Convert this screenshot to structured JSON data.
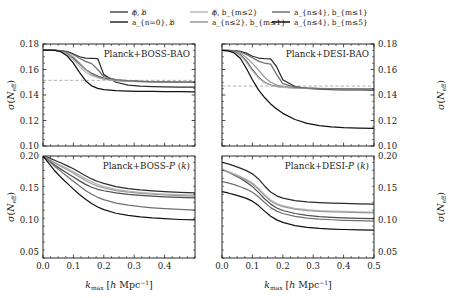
{
  "figure": {
    "xlabel": "k_max [h Mpc^-1]",
    "ylabel": "sigma(N_eff)"
  },
  "legend": {
    "entries": [
      {
        "id": "nophi-nob",
        "label": "ϕ̸, b̸",
        "color": "#4d4d4d"
      },
      {
        "id": "an0-nob",
        "label": "a_{n=0}, b̸",
        "color": "#2b2b2b"
      },
      {
        "id": "nophi-bm2",
        "label": "ϕ̸, b_{m≤2}",
        "color": "#b8b8b8"
      },
      {
        "id": "an2-bm1",
        "label": "a_{n≤2}, b_{m≤1}",
        "color": "#9a9a9a"
      },
      {
        "id": "an4-bm1",
        "label": "a_{n≤4}, b_{m≤1}",
        "color": "#707070"
      },
      {
        "id": "an4-bm5",
        "label": "a_{n≤4}, b_{m≤5}",
        "color": "#111111"
      }
    ]
  },
  "chart_data": [
    {
      "type": "line",
      "panel": "top-left",
      "title": "Planck+BOSS-BAO",
      "xlabel": "k_max [h Mpc^-1]",
      "ylabel": "sigma(N_eff)",
      "xlim": [
        0.0,
        0.5
      ],
      "ylim": [
        0.1,
        0.18
      ],
      "xticks": [
        0.0,
        0.1,
        0.2,
        0.3,
        0.4
      ],
      "yticks": [
        0.1,
        0.12,
        0.14,
        0.16,
        0.18
      ],
      "grid": false,
      "reference_line": {
        "y": 0.1515,
        "style": "dashed",
        "color": "#9a9a9a"
      },
      "x": [
        0.0,
        0.02,
        0.04,
        0.06,
        0.08,
        0.1,
        0.12,
        0.14,
        0.16,
        0.18,
        0.2,
        0.24,
        0.28,
        0.32,
        0.36,
        0.4,
        0.45,
        0.5
      ],
      "series": [
        {
          "name": "ϕ̸, b̸",
          "color": "#4d4d4d",
          "values": [
            0.1752,
            0.1752,
            0.175,
            0.1742,
            0.1724,
            0.1688,
            0.1645,
            0.16,
            0.157,
            0.1548,
            0.1532,
            0.1516,
            0.151,
            0.1506,
            0.1504,
            0.1502,
            0.1501,
            0.15
          ]
        },
        {
          "name": "a_{n=0}, b̸",
          "color": "#2b2b2b",
          "values": [
            0.1752,
            0.1752,
            0.1751,
            0.1748,
            0.174,
            0.1722,
            0.17,
            0.169,
            0.1688,
            0.1686,
            0.156,
            0.15,
            0.1478,
            0.147,
            0.1466,
            0.1464,
            0.1462,
            0.1461
          ]
        },
        {
          "name": "ϕ̸, b_{m≤2}",
          "color": "#b8b8b8",
          "values": [
            0.1752,
            0.1752,
            0.175,
            0.174,
            0.1716,
            0.1676,
            0.1622,
            0.1578,
            0.1552,
            0.1536,
            0.1524,
            0.1512,
            0.1507,
            0.1504,
            0.1502,
            0.1501,
            0.15,
            0.1499
          ]
        },
        {
          "name": "a_{n≤2}, b_{m≤1}",
          "color": "#9a9a9a",
          "values": [
            0.1752,
            0.1752,
            0.1751,
            0.1744,
            0.1728,
            0.1698,
            0.1652,
            0.16,
            0.1562,
            0.154,
            0.1527,
            0.1513,
            0.1508,
            0.1505,
            0.1503,
            0.1501,
            0.15,
            0.1499
          ]
        },
        {
          "name": "a_{n≤4}, b_{m≤1}",
          "color": "#707070",
          "values": [
            0.1752,
            0.1752,
            0.1751,
            0.1747,
            0.1737,
            0.1716,
            0.1688,
            0.1664,
            0.1646,
            0.16,
            0.1545,
            0.152,
            0.1512,
            0.1507,
            0.1505,
            0.1503,
            0.1501,
            0.15
          ]
        },
        {
          "name": "a_{n≤4}, b_{m≤5}",
          "color": "#111111",
          "values": [
            0.1752,
            0.1752,
            0.175,
            0.1738,
            0.1706,
            0.165,
            0.1578,
            0.1512,
            0.1472,
            0.1452,
            0.1442,
            0.1434,
            0.1431,
            0.1429,
            0.1428,
            0.1427,
            0.1426,
            0.1425
          ]
        }
      ]
    },
    {
      "type": "line",
      "panel": "top-right",
      "title": "Planck+DESI-BAO",
      "xlabel": "k_max [h Mpc^-1]",
      "ylabel": "sigma(N_eff)",
      "xlim": [
        0.0,
        0.5
      ],
      "ylim": [
        0.1,
        0.18
      ],
      "xticks": [
        0.0,
        0.1,
        0.2,
        0.3,
        0.4,
        0.5
      ],
      "yticks": [
        0.1,
        0.12,
        0.14,
        0.16,
        0.18
      ],
      "grid": false,
      "reference_line": {
        "y": 0.147,
        "style": "dashed",
        "color": "#9a9a9a"
      },
      "x": [
        0.0,
        0.02,
        0.04,
        0.06,
        0.08,
        0.1,
        0.12,
        0.14,
        0.16,
        0.18,
        0.2,
        0.24,
        0.28,
        0.32,
        0.36,
        0.4,
        0.45,
        0.5
      ],
      "series": [
        {
          "name": "ϕ̸, b̸",
          "color": "#4d4d4d",
          "values": [
            0.175,
            0.1748,
            0.174,
            0.1716,
            0.1668,
            0.16,
            0.154,
            0.15,
            0.1478,
            0.1468,
            0.1462,
            0.1456,
            0.1453,
            0.1451,
            0.145,
            0.1449,
            0.1448,
            0.1447
          ]
        },
        {
          "name": "a_{n=0}, b̸",
          "color": "#2b2b2b",
          "values": [
            0.175,
            0.175,
            0.1748,
            0.1742,
            0.1728,
            0.1704,
            0.169,
            0.1686,
            0.1684,
            0.162,
            0.152,
            0.1466,
            0.1452,
            0.1446,
            0.1443,
            0.1441,
            0.144,
            0.1439
          ]
        },
        {
          "name": "ϕ̸, b_{m≤2}",
          "color": "#b8b8b8",
          "values": [
            0.175,
            0.1748,
            0.1738,
            0.171,
            0.1656,
            0.159,
            0.1534,
            0.1496,
            0.1476,
            0.1466,
            0.146,
            0.1454,
            0.1452,
            0.145,
            0.1449,
            0.1448,
            0.1447,
            0.1446
          ]
        },
        {
          "name": "a_{n≤2}, b_{m≤1}",
          "color": "#9a9a9a",
          "values": [
            0.175,
            0.1749,
            0.1744,
            0.1728,
            0.1694,
            0.1648,
            0.1596,
            0.154,
            0.15,
            0.1478,
            0.1468,
            0.1458,
            0.1454,
            0.1452,
            0.145,
            0.1449,
            0.1448,
            0.1447
          ]
        },
        {
          "name": "a_{n≤4}, b_{m≤1}",
          "color": "#707070",
          "values": [
            0.175,
            0.175,
            0.1747,
            0.1738,
            0.1718,
            0.1692,
            0.1666,
            0.165,
            0.1642,
            0.156,
            0.149,
            0.1462,
            0.1454,
            0.1451,
            0.1449,
            0.1448,
            0.1447,
            0.1446
          ]
        },
        {
          "name": "a_{n≤4}, b_{m≤5}",
          "color": "#111111",
          "values": [
            0.175,
            0.1746,
            0.173,
            0.1688,
            0.161,
            0.152,
            0.144,
            0.138,
            0.133,
            0.129,
            0.1256,
            0.1208,
            0.1178,
            0.116,
            0.115,
            0.1144,
            0.114,
            0.1138
          ]
        }
      ]
    },
    {
      "type": "line",
      "panel": "bottom-left",
      "title": "Planck+BOSS-P (k)",
      "xlabel": "k_max [h Mpc^-1]",
      "ylabel": "sigma(N_eff)",
      "xlim": [
        0.0,
        0.5
      ],
      "ylim": [
        0.04,
        0.2
      ],
      "xticks": [
        0.0,
        0.1,
        0.2,
        0.3,
        0.4
      ],
      "yticks": [
        0.05,
        0.1,
        0.15,
        0.2
      ],
      "grid": false,
      "x": [
        0.0,
        0.02,
        0.04,
        0.06,
        0.08,
        0.1,
        0.12,
        0.14,
        0.16,
        0.18,
        0.2,
        0.24,
        0.28,
        0.32,
        0.36,
        0.4,
        0.45,
        0.5
      ],
      "series": [
        {
          "name": "ϕ̸, b̸",
          "color": "#4d4d4d",
          "values": [
            0.2,
            0.193,
            0.185,
            0.179,
            0.173,
            0.167,
            0.161,
            0.1555,
            0.151,
            0.1478,
            0.1455,
            0.142,
            0.1398,
            0.1382,
            0.137,
            0.136,
            0.135,
            0.1342
          ]
        },
        {
          "name": "a_{n=0}, b̸",
          "color": "#2b2b2b",
          "values": [
            0.2,
            0.197,
            0.193,
            0.189,
            0.1845,
            0.18,
            0.1745,
            0.169,
            0.164,
            0.16,
            0.157,
            0.152,
            0.149,
            0.1468,
            0.1452,
            0.144,
            0.1428,
            0.142
          ]
        },
        {
          "name": "ϕ̸, b_{m≤2}",
          "color": "#b8b8b8",
          "values": [
            0.2,
            0.195,
            0.1895,
            0.185,
            0.1805,
            0.1755,
            0.17,
            0.1645,
            0.1595,
            0.1555,
            0.1525,
            0.1478,
            0.145,
            0.143,
            0.1415,
            0.1404,
            0.1393,
            0.1385
          ]
        },
        {
          "name": "a_{n≤2}, b_{m≤1}",
          "color": "#9a9a9a",
          "values": [
            0.2,
            0.1945,
            0.1885,
            0.1835,
            0.1785,
            0.173,
            0.1672,
            0.1615,
            0.1565,
            0.1528,
            0.15,
            0.1458,
            0.1432,
            0.1414,
            0.14,
            0.1389,
            0.1378,
            0.137
          ]
        },
        {
          "name": "a_{n≤4}, b_{m≤1}",
          "color": "#707070",
          "values": [
            0.2,
            0.192,
            0.183,
            0.1755,
            0.168,
            0.1605,
            0.153,
            0.146,
            0.14,
            0.1352,
            0.1315,
            0.1262,
            0.1228,
            0.1205,
            0.1188,
            0.1175,
            0.1162,
            0.1152
          ]
        },
        {
          "name": "a_{n≤4}, b_{m≤5}",
          "color": "#111111",
          "values": [
            0.2,
            0.188,
            0.176,
            0.166,
            0.157,
            0.148,
            0.1395,
            0.132,
            0.1255,
            0.12,
            0.1158,
            0.1102,
            0.1068,
            0.1045,
            0.1028,
            0.1016,
            0.1004,
            0.0996
          ]
        }
      ]
    },
    {
      "type": "line",
      "panel": "bottom-right",
      "title": "Planck+DESI-P (k)",
      "xlabel": "k_max [h Mpc^-1]",
      "ylabel": "sigma(N_eff)",
      "xlim": [
        0.0,
        0.5
      ],
      "ylim": [
        0.04,
        0.2
      ],
      "xticks": [
        0.0,
        0.1,
        0.2,
        0.3,
        0.4,
        0.5
      ],
      "yticks": [
        0.05,
        0.1,
        0.15,
        0.2
      ],
      "grid": false,
      "x": [
        0.0,
        0.02,
        0.04,
        0.06,
        0.08,
        0.1,
        0.12,
        0.14,
        0.16,
        0.18,
        0.2,
        0.24,
        0.28,
        0.32,
        0.36,
        0.4,
        0.45,
        0.5
      ],
      "series": [
        {
          "name": "ϕ̸, b̸",
          "color": "#4d4d4d",
          "values": [
            0.179,
            0.175,
            0.17,
            0.165,
            0.159,
            0.152,
            0.143,
            0.133,
            0.1245,
            0.1185,
            0.1145,
            0.1098,
            0.1068,
            0.105,
            0.1038,
            0.103,
            0.1022,
            0.1016
          ]
        },
        {
          "name": "a_{n=0}, b̸",
          "color": "#2b2b2b",
          "values": [
            0.19,
            0.1875,
            0.1845,
            0.181,
            0.177,
            0.172,
            0.164,
            0.153,
            0.1435,
            0.1375,
            0.134,
            0.13,
            0.128,
            0.1268,
            0.126,
            0.1255,
            0.125,
            0.1246
          ]
        },
        {
          "name": "ϕ̸, b_{m≤2}",
          "color": "#b8b8b8",
          "values": [
            0.179,
            0.176,
            0.172,
            0.168,
            0.1635,
            0.158,
            0.1495,
            0.1395,
            0.131,
            0.1255,
            0.122,
            0.118,
            0.1158,
            0.1145,
            0.1136,
            0.113,
            0.1124,
            0.112
          ]
        },
        {
          "name": "a_{n≤2}, b_{m≤1}",
          "color": "#9a9a9a",
          "values": [
            0.178,
            0.1748,
            0.1706,
            0.1664,
            0.1618,
            0.1562,
            0.1478,
            0.1378,
            0.1295,
            0.124,
            0.1206,
            0.1166,
            0.1145,
            0.1132,
            0.1124,
            0.1118,
            0.1112,
            0.1108
          ]
        },
        {
          "name": "a_{n≤4}, b_{m≤1}",
          "color": "#707070",
          "values": [
            0.16,
            0.1578,
            0.155,
            0.1518,
            0.148,
            0.1432,
            0.136,
            0.127,
            0.119,
            0.1135,
            0.1098,
            0.1052,
            0.1026,
            0.101,
            0.1,
            0.0992,
            0.0985,
            0.098
          ]
        },
        {
          "name": "a_{n≤4}, b_{m≤5}",
          "color": "#111111",
          "values": [
            0.144,
            0.142,
            0.1395,
            0.1368,
            0.1335,
            0.1292,
            0.1222,
            0.1135,
            0.1055,
            0.0998,
            0.0958,
            0.0908,
            0.088,
            0.0864,
            0.0854,
            0.0847,
            0.0841,
            0.0836
          ]
        }
      ]
    }
  ]
}
